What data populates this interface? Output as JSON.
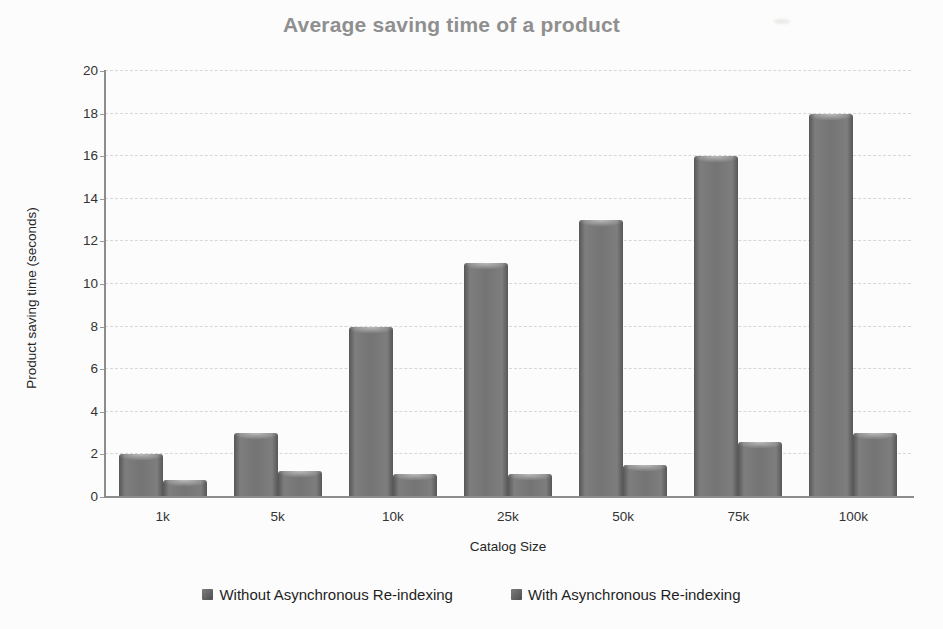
{
  "chart_data": {
    "type": "bar",
    "title": "Average saving time of a product",
    "categories": [
      "1k",
      "5k",
      "10k",
      "25k",
      "50k",
      "75k",
      "100k"
    ],
    "series": [
      {
        "name": "Without Asynchronous Re-indexing",
        "values": [
          2,
          3,
          8,
          11,
          13,
          16,
          18
        ]
      },
      {
        "name": "With Asynchronous Re-indexing",
        "values": [
          0.8,
          1.2,
          1.1,
          1.1,
          1.5,
          2.6,
          3
        ]
      }
    ],
    "xlabel": "Catalog Size",
    "ylabel": "Product saving time (seconds)",
    "ylim": [
      0,
      20
    ],
    "yticks": [
      0,
      2,
      4,
      6,
      8,
      10,
      12,
      14,
      16,
      18,
      20
    ],
    "grid": true,
    "gridline_style": "dashed",
    "legend_position": "bottom",
    "colors": {
      "bar_fill": "#717171",
      "bar_edge": "#575757",
      "title_text": "#8f8f8f",
      "axis_text": "#333333",
      "gridline": "#d7d7d5",
      "axis_line": "#8c8c8c",
      "background": "#fcfcfc"
    }
  }
}
